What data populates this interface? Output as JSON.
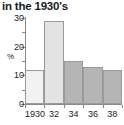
{
  "chart_data": {
    "type": "bar",
    "title": "in the 1930's",
    "xlabel": "",
    "ylabel": "%",
    "categories": [
      "1930",
      "32",
      "34",
      "36",
      "38"
    ],
    "values": [
      12,
      29,
      15,
      13,
      12
    ],
    "ylim": [
      0,
      30
    ],
    "yticks": [
      0,
      10,
      20,
      30
    ],
    "ytick_labels": [
      "0",
      "10",
      "20",
      "30"
    ],
    "minor_yticks": [
      5,
      15,
      25
    ],
    "grid": false,
    "legend": "none",
    "bar_colors": [
      "#f2f2f2",
      "#e3e3e3",
      "#b5b5b5",
      "#b5b5b5",
      "#b5b5b5"
    ],
    "bar_edge_color": "#9a9a9a",
    "axis_color": "#8a8a8a",
    "text_color": "#1a1a1a"
  }
}
